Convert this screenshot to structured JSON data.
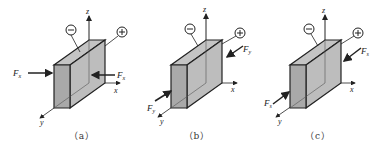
{
  "figure": {
    "panels": [
      {
        "id": "a",
        "caption": "（a）",
        "axes": {
          "x": "x",
          "y": "y",
          "z": "z"
        },
        "electrodes": {
          "negative": "⊖",
          "positive": "⊕"
        },
        "forces": [
          {
            "label": "F",
            "subscript": "x",
            "direction": "pushes +x on left face"
          },
          {
            "label": "F",
            "subscript": "x",
            "direction": "pushes -x on right face"
          }
        ]
      },
      {
        "id": "b",
        "caption": "（b）",
        "axes": {
          "x": "x",
          "y": "y",
          "z": "z"
        },
        "electrodes": {
          "negative": "⊖",
          "positive": "⊕"
        },
        "forces": [
          {
            "label": "F",
            "subscript": "y",
            "direction": "pushes -y on back face"
          },
          {
            "label": "F",
            "subscript": "y",
            "direction": "pushes +y on front face"
          }
        ]
      },
      {
        "id": "c",
        "caption": "（c）",
        "axes": {
          "x": "x",
          "y": "y",
          "z": "z"
        },
        "electrodes": {
          "negative": "⊖",
          "positive": "⊕"
        },
        "forces": [
          {
            "label": "F",
            "subscript": "s",
            "direction": "shear on right face"
          },
          {
            "label": "F",
            "subscript": "s",
            "direction": "shear on left face"
          }
        ]
      }
    ],
    "colors": {
      "face_fill": "#b8b8b8",
      "face_front": "#a9a9a9",
      "stroke": "#222222",
      "background": "#ffffff"
    }
  }
}
